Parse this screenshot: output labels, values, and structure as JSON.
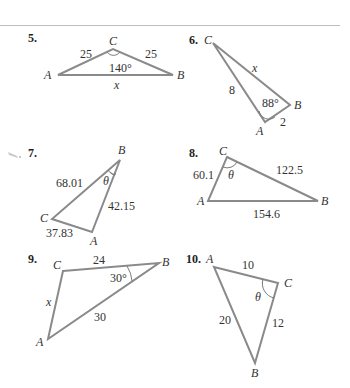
{
  "problems": [
    {
      "number": "5.",
      "vertices": {
        "A": "A",
        "B": "B",
        "C": "C"
      },
      "sides": {
        "AC": "25",
        "CB": "25",
        "AB": "x"
      },
      "angle": {
        "at": "C",
        "label": "140°"
      }
    },
    {
      "number": "6.",
      "vertices": {
        "A": "A",
        "B": "B",
        "C": "C"
      },
      "sides": {
        "CB": "x",
        "CA": "8",
        "AB": "2"
      },
      "angle": {
        "at": "A",
        "label": "88°"
      }
    },
    {
      "number": "7.",
      "vertices": {
        "A": "A",
        "B": "B",
        "C": "C"
      },
      "sides": {
        "CB": "68.01",
        "BA": "42.15",
        "CA": "37.83"
      },
      "angle": {
        "at": "B",
        "label": "θ"
      }
    },
    {
      "number": "8.",
      "vertices": {
        "A": "A",
        "B": "B",
        "C": "C"
      },
      "sides": {
        "AC": "60.1",
        "CB": "122.5",
        "AB": "154.6"
      },
      "angle": {
        "at": "C",
        "label": "θ"
      }
    },
    {
      "number": "9.",
      "vertices": {
        "A": "A",
        "B": "B",
        "C": "C"
      },
      "sides": {
        "CB": "24",
        "CA": "x",
        "AB": "30"
      },
      "angle": {
        "at": "B",
        "label": "30°"
      }
    },
    {
      "number": "10.",
      "vertices": {
        "A": "A",
        "B": "B",
        "C": "C"
      },
      "sides": {
        "AC": "10",
        "AB": "20",
        "CB": "12"
      },
      "angle": {
        "at": "C",
        "label": "θ"
      }
    }
  ]
}
